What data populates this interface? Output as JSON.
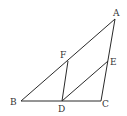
{
  "diagram": {
    "type": "geometry",
    "points": {
      "A": {
        "label": "A",
        "x": 115,
        "y": 19
      },
      "B": {
        "label": "B",
        "x": 21,
        "y": 101
      },
      "C": {
        "label": "C",
        "x": 101,
        "y": 101
      },
      "D": {
        "label": "D",
        "x": 62,
        "y": 101
      },
      "E": {
        "label": "E",
        "x": 108,
        "y": 61
      },
      "F": {
        "label": "F",
        "x": 68,
        "y": 61
      }
    },
    "segments": [
      [
        "A",
        "B"
      ],
      [
        "B",
        "C"
      ],
      [
        "C",
        "A"
      ],
      [
        "D",
        "F"
      ],
      [
        "D",
        "E"
      ]
    ],
    "labels": {
      "A": "A",
      "B": "B",
      "C": "C",
      "D": "D",
      "E": "E",
      "F": "F"
    }
  }
}
